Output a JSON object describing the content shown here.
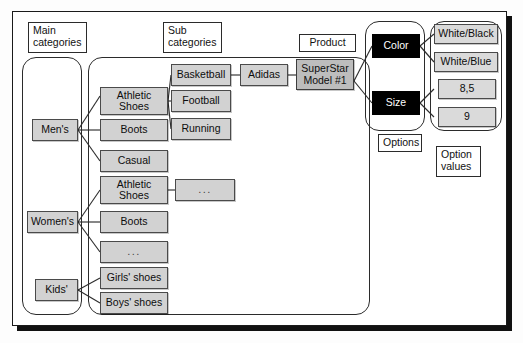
{
  "diagram": {
    "colors": {
      "node_fill": "#d2d2d2",
      "product_fill": "#bdbdbd",
      "option_fill": "#000000",
      "option_text": "#ffffff",
      "value_fill": "#dadada",
      "border": "#2b2b2b",
      "frame": "#1a1a1a"
    },
    "captions": {
      "main_categories": "Main\ncategories",
      "sub_categories": "Sub\ncategories",
      "product": "Product",
      "options": "Options",
      "option_values": "Option\nvalues"
    },
    "main_categories": [
      {
        "id": "mens",
        "label": "Men's"
      },
      {
        "id": "womens",
        "label": "Women's"
      },
      {
        "id": "kids",
        "label": "Kids'"
      }
    ],
    "sub_categories": [
      {
        "id": "mens-athletic",
        "label": "Athletic\nShoes",
        "parent": "mens"
      },
      {
        "id": "mens-boots",
        "label": "Boots",
        "parent": "mens"
      },
      {
        "id": "mens-casual",
        "label": "Casual",
        "parent": "mens"
      },
      {
        "id": "womens-athletic",
        "label": "Athletic\nShoes",
        "parent": "womens"
      },
      {
        "id": "womens-boots",
        "label": "Boots",
        "parent": "womens"
      },
      {
        "id": "womens-more",
        "label": "...",
        "parent": "womens"
      },
      {
        "id": "kids-girls",
        "label": "Girls' shoes",
        "parent": "kids"
      },
      {
        "id": "kids-boys",
        "label": "Boys' shoes",
        "parent": "kids"
      }
    ],
    "sub_sub_categories": [
      {
        "id": "basketball",
        "label": "Basketball",
        "parent": "mens-athletic"
      },
      {
        "id": "football",
        "label": "Football",
        "parent": "mens-athletic"
      },
      {
        "id": "running",
        "label": "Running",
        "parent": "mens-athletic"
      },
      {
        "id": "womens-athletic-more",
        "label": "...",
        "parent": "womens-athletic"
      }
    ],
    "brands": [
      {
        "id": "adidas",
        "label": "Adidas",
        "parent": "basketball"
      }
    ],
    "products": [
      {
        "id": "superstar",
        "label": "SuperStar\nModel #1",
        "parent": "adidas"
      }
    ],
    "options": [
      {
        "id": "color",
        "label": "Color",
        "parent": "superstar"
      },
      {
        "id": "size",
        "label": "Size",
        "parent": "superstar"
      }
    ],
    "option_values": [
      {
        "id": "white-black",
        "label": "White/Black",
        "parent": "color"
      },
      {
        "id": "white-blue",
        "label": "White/Blue",
        "parent": "color"
      },
      {
        "id": "size-85",
        "label": "8,5",
        "parent": "size"
      },
      {
        "id": "size-9",
        "label": "9",
        "parent": "size"
      }
    ]
  }
}
